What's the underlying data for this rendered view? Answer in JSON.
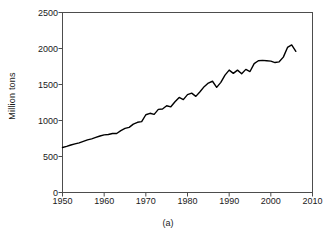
{
  "figure": {
    "caption": "(a)",
    "name": "world-production-line-chart"
  },
  "chart_data": {
    "type": "line",
    "title": "",
    "subtitle": "",
    "xlabel": "",
    "ylabel": "Million tons",
    "annotation": "(a)",
    "xlim": [
      1950,
      2010
    ],
    "ylim": [
      0,
      2500
    ],
    "xticks": [
      1950,
      1960,
      1970,
      1980,
      1990,
      2000,
      2010
    ],
    "yticks": [
      0,
      500,
      1000,
      1500,
      2000,
      2500
    ],
    "xtick_labels": [
      "1950",
      "1960",
      "1970",
      "1980",
      "1990",
      "2000",
      "2010"
    ],
    "ytick_labels": [
      "0",
      "500",
      "1000",
      "1500",
      "2000",
      "2500"
    ],
    "grid": false,
    "legend": false,
    "legend_position": "none",
    "series": [
      {
        "name": "Production",
        "color": "#000000",
        "x": [
          1950,
          1951,
          1952,
          1953,
          1954,
          1955,
          1956,
          1957,
          1958,
          1959,
          1960,
          1961,
          1962,
          1963,
          1964,
          1965,
          1966,
          1967,
          1968,
          1969,
          1970,
          1971,
          1972,
          1973,
          1974,
          1975,
          1976,
          1977,
          1978,
          1979,
          1980,
          1981,
          1982,
          1983,
          1984,
          1985,
          1986,
          1987,
          1988,
          1989,
          1990,
          1991,
          1992,
          1993,
          1994,
          1995,
          1996,
          1997,
          1998,
          1999,
          2000,
          2001,
          2002,
          2003,
          2004,
          2005,
          2006
        ],
        "values": [
          625,
          640,
          660,
          675,
          690,
          710,
          730,
          745,
          765,
          785,
          800,
          805,
          820,
          820,
          860,
          890,
          905,
          950,
          975,
          985,
          1080,
          1100,
          1085,
          1155,
          1160,
          1205,
          1190,
          1260,
          1320,
          1290,
          1360,
          1380,
          1335,
          1400,
          1470,
          1520,
          1545,
          1460,
          1530,
          1630,
          1700,
          1655,
          1700,
          1650,
          1710,
          1680,
          1790,
          1830,
          1835,
          1830,
          1825,
          1805,
          1815,
          1880,
          2015,
          2050,
          1960
        ]
      }
    ]
  }
}
